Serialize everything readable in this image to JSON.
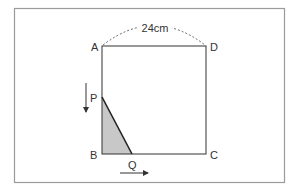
{
  "diagram": {
    "dimension_label": "24cm",
    "vertices": {
      "A": "A",
      "B": "B",
      "C": "C",
      "D": "D",
      "P": "P",
      "Q": "Q"
    },
    "motion": {
      "P_direction": "down",
      "Q_direction": "right"
    },
    "colors": {
      "stroke": "#333333",
      "shaded_triangle": "#c8c8c8",
      "frame": "#9a9a9a"
    }
  }
}
